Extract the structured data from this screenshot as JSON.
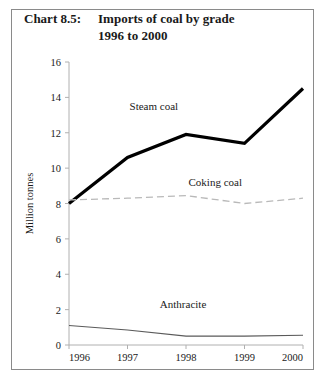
{
  "figure": {
    "chart_number": "Chart 8.5:",
    "title_line1": "Imports of coal by grade",
    "title_line2": "1996 to 2000",
    "border_color": "#8a8a8a"
  },
  "chart_data": {
    "type": "line",
    "title": "Imports of coal by grade 1996 to 2000",
    "subtitle": "Chart 8.5:",
    "xlabel": "",
    "ylabel": "Million tonnes",
    "categories": [
      "1996",
      "1997",
      "1998",
      "1999",
      "2000"
    ],
    "x": [
      1996,
      1997,
      1998,
      1999,
      2000
    ],
    "ylim": [
      0,
      16
    ],
    "yticks": [
      0,
      2,
      4,
      6,
      8,
      10,
      12,
      14,
      16
    ],
    "ytick_labels": [
      "0",
      "2",
      "4",
      "6",
      "8",
      "10",
      "12",
      "14",
      "16"
    ],
    "grid": false,
    "legend": "inline-annotations",
    "series": [
      {
        "name": "Steam coal",
        "values": [
          8.0,
          10.6,
          11.9,
          11.4,
          14.5
        ],
        "style": "solid-thick",
        "color": "#000000",
        "width": 3.2,
        "label_x": 1997.45,
        "label_y": 13.3
      },
      {
        "name": "Coking coal",
        "values": [
          8.2,
          8.3,
          8.45,
          8.0,
          8.3
        ],
        "style": "dashed",
        "color": "#b9b9b9",
        "width": 1.3,
        "label_x": 1998.5,
        "label_y": 9.0
      },
      {
        "name": "Anthracite",
        "values": [
          1.1,
          0.85,
          0.5,
          0.5,
          0.55
        ],
        "style": "solid-thin",
        "color": "#5a5a5a",
        "width": 1.1,
        "label_x": 1997.95,
        "label_y": 2.1
      }
    ]
  }
}
